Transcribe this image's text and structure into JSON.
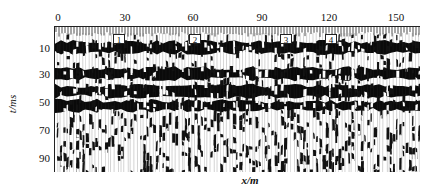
{
  "chart_data": {
    "type": "heatmap",
    "subtype": "seismic wiggle/variable-area section",
    "title": "",
    "xlabel": "x/m",
    "ylabel": "t/ms",
    "x_ticks": [
      0,
      30,
      60,
      90,
      120,
      150
    ],
    "y_ticks": [
      10,
      30,
      50,
      70,
      90
    ],
    "xlim": [
      0,
      160
    ],
    "ylim": [
      0,
      100
    ],
    "x_axis_position": "top",
    "y_axis_inverted": true,
    "grid": false,
    "legend": null,
    "annotations": [
      {
        "label": "1",
        "x": 29,
        "t": 5
      },
      {
        "label": "2",
        "x": 64,
        "t": 5
      },
      {
        "label": "3",
        "x": 102,
        "t": 5
      },
      {
        "label": "4",
        "x": 123,
        "t": 5
      }
    ],
    "reflection_bands_ms": [
      {
        "t_center": 15,
        "description": "strong dark band"
      },
      {
        "t_center": 33,
        "description": "dark band"
      },
      {
        "t_center": 45,
        "description": "dark band"
      },
      {
        "t_center": 55,
        "description": "dark band, weaker to the right"
      }
    ],
    "below_70ms": "chaotic/noisy diffraction pattern"
  },
  "axes": {
    "x_tick_labels": [
      "0",
      "30",
      "60",
      "90",
      "120",
      "150"
    ],
    "y_tick_labels": [
      "10",
      "30",
      "50",
      "70",
      "90"
    ],
    "xlabel": "x/m",
    "ylabel": "t/ms"
  },
  "markers": [
    "1",
    "2",
    "3",
    "4"
  ]
}
